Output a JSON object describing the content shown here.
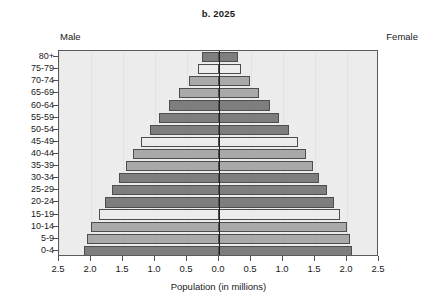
{
  "figure": {
    "title": "b. 2025",
    "male_label": "Male",
    "female_label": "Female",
    "xaxis_title": "Population (in millions)"
  },
  "chart_data": {
    "type": "bar",
    "subtype": "population-pyramid",
    "title": "b. 2025",
    "xlabel": "Population (in millions)",
    "ylabel": "",
    "xlim": [
      -2.5,
      2.5
    ],
    "xticks": [
      2.5,
      2.0,
      1.5,
      1.0,
      0.5,
      0.0,
      0.5,
      1.0,
      1.5,
      2.0,
      2.5
    ],
    "xtick_labels": [
      "2.5",
      "2.0",
      "1.5",
      "1.0",
      "0.5",
      "0.0",
      "0.5",
      "1.0",
      "1.5",
      "2.0",
      "2.5"
    ],
    "grid": true,
    "legend": false,
    "categories": [
      "80+",
      "75-79",
      "70-74",
      "65-69",
      "60-64",
      "55-59",
      "50-54",
      "45-49",
      "40-44",
      "35-39",
      "30-34",
      "25-29",
      "20-24",
      "15-19",
      "10-14",
      "5-9",
      "0-4"
    ],
    "series": [
      {
        "name": "Male",
        "side": "left",
        "values": [
          0.27,
          0.33,
          0.47,
          0.62,
          0.78,
          0.93,
          1.08,
          1.22,
          1.35,
          1.46,
          1.56,
          1.67,
          1.78,
          1.88,
          2.0,
          2.06,
          2.11
        ]
      },
      {
        "name": "Female",
        "side": "right",
        "values": [
          0.3,
          0.35,
          0.48,
          0.63,
          0.79,
          0.94,
          1.09,
          1.23,
          1.36,
          1.47,
          1.57,
          1.68,
          1.79,
          1.89,
          2.0,
          2.05,
          2.08
        ]
      }
    ],
    "bar_shades": [
      "dark",
      "light",
      "mid",
      "mid",
      "dark",
      "dark",
      "dark",
      "light",
      "mid",
      "mid",
      "dark",
      "dark",
      "dark",
      "light",
      "mid",
      "mid",
      "dark"
    ],
    "colors": {
      "shade_dark": "#7e7e7e",
      "shade_mid": "#a9a9a9",
      "shade_light": "#ececec",
      "panel_background": "#ececed",
      "axis_line": "#222222",
      "bar_outline": "#4d4d4d"
    }
  }
}
